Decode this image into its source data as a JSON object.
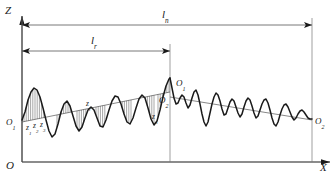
{
  "figure": {
    "kind": "surface-roughness-profile-diagram",
    "background": "#ffffff",
    "stroke_color": "#1a1a1a",
    "thin_color": "#555555",
    "hatch_color": "#3a3a3a",
    "width": 336,
    "height": 180
  },
  "axes": {
    "z_axis_label": "Z",
    "x_axis_label": "X",
    "origin_label": "O"
  },
  "dimensions": [
    {
      "name": "evaluation-length",
      "label": "ln",
      "label_main": "l",
      "label_sub": "n",
      "x_start": 22,
      "x_end": 312,
      "y": 25
    },
    {
      "name": "sampling-length",
      "label": "lr",
      "label_main": "l",
      "label_sub": "r",
      "x_start": 22,
      "x_end": 170,
      "y": 51
    }
  ],
  "points": [
    {
      "name": "origin-left-O1",
      "label_main": "O",
      "label_sub": "1",
      "x": 6,
      "y": 118
    },
    {
      "name": "mid-upper-O1",
      "label_main": "O",
      "label_sub": "1",
      "x": 176,
      "y": 79
    },
    {
      "name": "mid-lower-O2",
      "label_main": "O",
      "label_sub": "2",
      "x": 159,
      "y": 96
    },
    {
      "name": "right-end-O2",
      "label_main": "O",
      "label_sub": "2",
      "x": 315,
      "y": 117
    }
  ],
  "ordinate_labels": [
    {
      "name": "z1",
      "label_main": "z",
      "label_sub": "1",
      "x": 26,
      "y": 124
    },
    {
      "name": "z2",
      "label_main": "z",
      "label_sub": "2",
      "x": 33,
      "y": 122
    },
    {
      "name": "z3",
      "label_main": "z",
      "label_sub": "3",
      "x": 40,
      "y": 121
    },
    {
      "name": "zi",
      "label_main": "z",
      "label_sub": "i",
      "x": 86,
      "y": 100
    },
    {
      "name": "zn",
      "label_main": "z",
      "label_sub": "n",
      "x": 152,
      "y": 113
    }
  ],
  "chart_data": {
    "type": "line",
    "title": "",
    "xlabel": "X",
    "ylabel": "Z",
    "mean_lines": [
      {
        "name": "mean-line-left",
        "x1": 22,
        "y1": 122,
        "x2": 170,
        "y2": 92
      },
      {
        "name": "mean-line-right",
        "x1": 170,
        "y1": 97,
        "x2": 312,
        "y2": 120
      }
    ],
    "profile_left": "22,120 25,112 28,100 31,92 34,88 37,90 40,97 43,108 46,120 49,131 52,137 55,134 58,124 61,112 64,104 67,101 70,106 73,116 76,126 79,131 82,127 85,118 88,110 91,107 94,110 97,118 100,126 103,127 106,120 109,110 112,101 115,96 118,97 121,104 124,114 127,122 130,124 133,118 136,108 139,99 142,95 145,98 148,108 151,119 154,125 157,121 160,110 163,97 166,86 169,79 170,78",
    "profile_right": "170,78 172,88 174,98 176,104 178,103 180,98 182,95 184,97 186,103 188,108 190,105 192,98 194,92 196,90 198,95 200,104 202,114 204,122 206,126 208,122 210,113 212,104 214,97 216,93 218,95 220,101 222,109 224,115 226,114 228,108 230,102 232,99 234,101 236,107 238,113 240,117 242,114 244,107 246,101 248,98 250,100 252,106 254,113 256,118 258,116 260,110 262,104 264,100 266,99 268,103 270,110 272,118 274,124 276,126 278,122 280,115 282,109 284,105 286,104 288,107 290,112 292,117 294,120 296,118 298,114 300,111 302,110 304,112 306,115 308,118 310,119 312,119",
    "hatch_groups": [
      {
        "x_start": 24,
        "x_end": 46,
        "step": 2.2
      },
      {
        "x_start": 57,
        "x_end": 72,
        "step": 2.2
      },
      {
        "x_start": 77,
        "x_end": 88,
        "step": 2.2
      },
      {
        "x_start": 96,
        "x_end": 107,
        "step": 2.2
      },
      {
        "x_start": 120,
        "x_end": 133,
        "step": 2.2
      },
      {
        "x_start": 143,
        "x_end": 156,
        "step": 2.2
      },
      {
        "x_start": 158,
        "x_end": 170,
        "step": 2.2
      }
    ]
  }
}
